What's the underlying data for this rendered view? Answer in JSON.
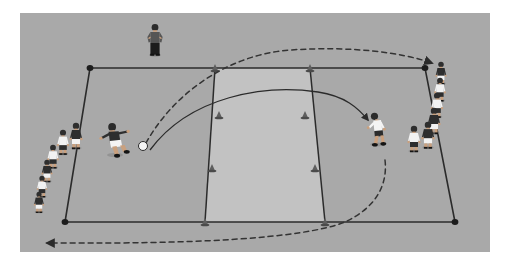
{
  "diagram": {
    "type": "sports-drill-diagram",
    "sport": "soccer",
    "view": "perspective-pitch-view"
  },
  "colors": {
    "page_background": "#ffffff",
    "pitch_fill": "#a9a9a9",
    "channel_fill": "#c2c2c2",
    "line_stroke": "#2b2b2b",
    "cone_fill": "#5f5f5f",
    "ball_fill": "#f4f4f4",
    "kit_dark": "#2e2e2e",
    "kit_light": "#f2f2f2",
    "skin": "#c9a07e",
    "dashed_stroke": "#3a3a3a",
    "solid_arrow_stroke": "#2b2b2b"
  },
  "pitch": {
    "name": "training-grid",
    "outline_points": "90,68 425,68 455,222 65,222",
    "corner_cones": [
      {
        "label": "top-left-corner-cone",
        "x": 90,
        "y": 68
      },
      {
        "label": "top-right-corner-cone",
        "x": 425,
        "y": 68
      },
      {
        "label": "bottom-right-corner-cone",
        "x": 455,
        "y": 222
      },
      {
        "label": "bottom-left-corner-cone",
        "x": 65,
        "y": 222
      }
    ]
  },
  "channel": {
    "name": "central-channel",
    "points": "215,68 310,68 325,222 205,222",
    "left_line_cones": [
      {
        "x": 215,
        "y": 68
      },
      {
        "x": 219,
        "y": 115
      },
      {
        "x": 212,
        "y": 168
      },
      {
        "x": 205,
        "y": 222
      }
    ],
    "right_line_cones": [
      {
        "x": 310,
        "y": 68
      },
      {
        "x": 305,
        "y": 115
      },
      {
        "x": 315,
        "y": 168
      },
      {
        "x": 325,
        "y": 222
      }
    ]
  },
  "ball": {
    "name": "soccer-ball",
    "x": 143,
    "y": 146,
    "radius": 4.5
  },
  "players": {
    "coach": {
      "name": "coach",
      "x": 155,
      "y": 24,
      "scale": 1.0,
      "kit": "dark",
      "pose": "standing-hands-on-hips"
    },
    "kicker": {
      "name": "kicker",
      "x": 115,
      "y": 124,
      "scale": 1.15,
      "kit": "dark-shirt-light-shorts",
      "pose": "kicking"
    },
    "receiver": {
      "name": "receiver",
      "x": 377,
      "y": 113,
      "scale": 1.05,
      "kit": "light-shirt-dark-shorts",
      "pose": "running-to-receive"
    },
    "left_queue": {
      "name": "left-player-queue",
      "count": 6,
      "members": [
        {
          "x": 76,
          "y": 123,
          "scale": 1.0,
          "kit": "dark-shirt-light-shorts"
        },
        {
          "x": 63,
          "y": 130,
          "scale": 0.95,
          "kit": "light-shirt-dark-shorts"
        },
        {
          "x": 53,
          "y": 145,
          "scale": 0.9,
          "kit": "light-shirt-dark-shorts"
        },
        {
          "x": 47,
          "y": 160,
          "scale": 0.85,
          "kit": "dark-shirt-light-shorts"
        },
        {
          "x": 42,
          "y": 176,
          "scale": 0.82,
          "kit": "light-shirt-dark-shorts"
        },
        {
          "x": 39,
          "y": 192,
          "scale": 0.8,
          "kit": "dark-shirt-light-shorts"
        }
      ]
    },
    "right_queue": {
      "name": "right-player-queue",
      "count": 6,
      "members": [
        {
          "x": 441,
          "y": 62,
          "scale": 0.86,
          "kit": "dark-shirt-light-shorts"
        },
        {
          "x": 440,
          "y": 78,
          "scale": 0.9,
          "kit": "light-shirt-dark-shorts"
        },
        {
          "x": 437,
          "y": 93,
          "scale": 0.95,
          "kit": "light-shirt-dark-shorts"
        },
        {
          "x": 434,
          "y": 108,
          "scale": 1.0,
          "kit": "dark-shirt-light-shorts"
        },
        {
          "x": 428,
          "y": 122,
          "scale": 1.02,
          "kit": "dark-shirt-light-shorts"
        },
        {
          "x": 414,
          "y": 126,
          "scale": 1.0,
          "kit": "light-shirt-dark-shorts"
        }
      ]
    }
  },
  "paths": {
    "ball_flight_dashed": {
      "name": "ball-flight-path",
      "style": "dashed",
      "description": "Lofted pass arc from ball over the grid to the right side",
      "d": "M 146 143 C 172 96, 225 55, 290 50 C 350 46, 400 52, 432 63",
      "arrowhead": {
        "x": 432,
        "y": 63,
        "angle": 20
      }
    },
    "run_solid": {
      "name": "receiver-run-path",
      "style": "solid",
      "description": "Curved run of the ball/player from kicker to receiver",
      "d": "M 150 150 C 190 96, 265 84, 318 92 C 345 96, 358 108, 368 120",
      "arrowhead": {
        "x": 368,
        "y": 121,
        "angle": 52
      }
    },
    "return_dashed": {
      "name": "return-run-path",
      "style": "dashed",
      "description": "Dashed return route down the right side and along the bottom back to the left queue",
      "d": "M 385 160 C 388 186, 375 208, 345 222 C 300 240, 180 243, 95 243 L 47 243",
      "arrowhead": {
        "x": 45,
        "y": 243,
        "angle": 180
      }
    }
  },
  "legend": {
    "dashed_meaning": "ball flight / player movement (dashed)",
    "solid_meaning": "pass direction (solid)"
  }
}
